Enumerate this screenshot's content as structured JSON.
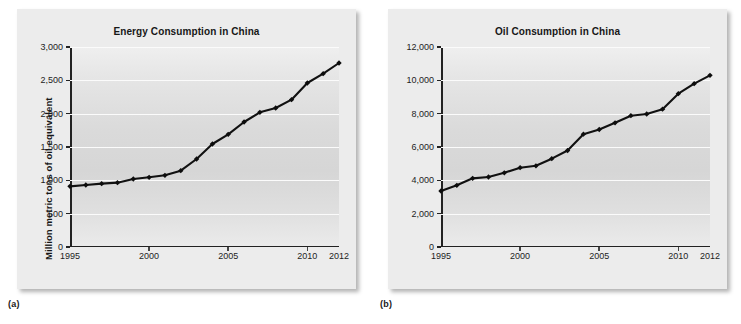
{
  "figure": {
    "caption_a": "(a)",
    "caption_b": "(b)"
  },
  "chart_data": [
    {
      "type": "line",
      "panel": "a",
      "title": "Energy Consumption in China",
      "xlabel": "",
      "ylabel": "Million metric tons of oil equivalent",
      "xlim": [
        1995,
        2012
      ],
      "ylim": [
        0,
        3000
      ],
      "grid": true,
      "legend": "none",
      "marker": "diamond",
      "line_color": "#111111",
      "x_ticks": [
        1995,
        2000,
        2005,
        2010,
        2012
      ],
      "x_tick_labels": [
        "1995",
        "2000",
        "2005",
        "2010",
        "2012"
      ],
      "y_ticks": [
        0,
        500,
        1000,
        1500,
        2000,
        2500,
        3000
      ],
      "y_tick_labels": [
        "0",
        "500",
        "1,000",
        "1,500",
        "2,000",
        "2,500",
        "3,000"
      ],
      "x": [
        1995,
        1996,
        1997,
        1998,
        1999,
        2000,
        2001,
        2002,
        2003,
        2004,
        2005,
        2006,
        2007,
        2008,
        2009,
        2010,
        2011,
        2012
      ],
      "values": [
        910,
        930,
        950,
        965,
        1020,
        1045,
        1075,
        1145,
        1320,
        1545,
        1690,
        1875,
        2020,
        2085,
        2210,
        2460,
        2600,
        2760
      ]
    },
    {
      "type": "line",
      "panel": "b",
      "title": "Oil Consumption in China",
      "xlabel": "",
      "ylabel": "Thousand barrels of oil per day",
      "xlim": [
        1995,
        2012
      ],
      "ylim": [
        0,
        12000
      ],
      "grid": true,
      "legend": "none",
      "marker": "diamond",
      "line_color": "#111111",
      "x_ticks": [
        1995,
        2000,
        2005,
        2010,
        2012
      ],
      "x_tick_labels": [
        "1995",
        "2000",
        "2005",
        "2010",
        "2012"
      ],
      "y_ticks": [
        0,
        2000,
        4000,
        6000,
        8000,
        10000,
        12000
      ],
      "y_tick_labels": [
        "0",
        "2,000",
        "4,000",
        "6,000",
        "8,000",
        "10,000",
        "12,000"
      ],
      "x": [
        1995,
        1996,
        1997,
        1998,
        1999,
        2000,
        2001,
        2002,
        2003,
        2004,
        2005,
        2006,
        2007,
        2008,
        2009,
        2010,
        2011,
        2012
      ],
      "values": [
        3360,
        3700,
        4120,
        4200,
        4450,
        4760,
        4870,
        5300,
        5790,
        6770,
        7050,
        7450,
        7880,
        7980,
        8270,
        9200,
        9800,
        10300
      ]
    }
  ]
}
